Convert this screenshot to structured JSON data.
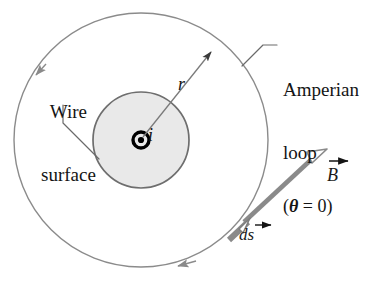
{
  "figure": {
    "background_color": "#ffffff"
  },
  "labels": {
    "amperian_loop_line1": "Amperian",
    "amperian_loop_line2": "loop",
    "wire_surface_line1": "Wire",
    "wire_surface_line2": "surface",
    "radius": "r",
    "current": "i",
    "theta": "(θ = 0)",
    "theta_open": "(",
    "theta_symbol": "θ",
    "theta_equals": " = 0)",
    "B_field": "B",
    "ds_element": "ds"
  },
  "geometry": {
    "center_x": 141,
    "center_y": 140,
    "amperian_loop_radius": 127,
    "wire_radius": 48,
    "current_dot_outer_radius": 8,
    "current_dot_inner_radius": 3
  },
  "colors": {
    "loop_stroke": "#8b8b8b",
    "wire_stroke": "#6e6e6e",
    "wire_fill": "#e9e9e9",
    "vector_gray": "#8a8a8a",
    "leader_line": "#6a6a6a",
    "text": "#141414",
    "current_symbol": "#000000"
  },
  "elements": {
    "amperian_loop_direction": "counterclockwise",
    "B_vector_direction": "tangent, up-right",
    "ds_vector_direction": "tangent to loop",
    "current_direction": "out of page"
  }
}
